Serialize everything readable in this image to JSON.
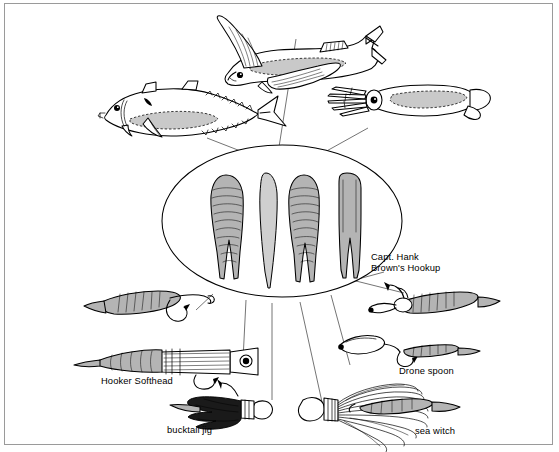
{
  "figure": {
    "kind": "illustration-diagram",
    "background_color": "#ffffff",
    "ink_color": "#000000",
    "border_color": "#9a9a9a",
    "fill_gray": "#b4b4b4",
    "fill_gray_light": "#d2d2d2",
    "fill_black": "#1a1a1a"
  },
  "baits": [
    {
      "id": "flyingfish",
      "name": "flying fish",
      "position": "top-center",
      "description": "Flying fish with long outstretched pectoral wing fins, forked tail, shaded flank"
    },
    {
      "id": "mackerel",
      "name": "mackerel",
      "position": "upper-left",
      "description": "Streamlined mackerel/tuna-type baitfish with finlets, deeply forked tail, shaded belly"
    },
    {
      "id": "squid",
      "name": "squid",
      "position": "upper-right",
      "description": "Squid with trailing tentacles, round eye, shaded mantle and tail fins"
    }
  ],
  "center_oval": {
    "name": "soft plastic lure skirts and bodies",
    "shapes": [
      {
        "id": "skirt-ribbed-split-1",
        "style": "ribbed split-tail",
        "fill": "#b4b4b4"
      },
      {
        "id": "body-taper-1",
        "style": "smooth single taper",
        "fill": "#c0c0c0"
      },
      {
        "id": "skirt-ribbed-split-2",
        "style": "ribbed split-tail",
        "fill": "#b4b4b4"
      },
      {
        "id": "skirt-plain-split",
        "style": "plain split-tail",
        "fill": "#b8b8b8"
      }
    ]
  },
  "lures": [
    {
      "id": "hookup",
      "label": "Capt. Hank\nBrown's Hookup",
      "label_lines": [
        "Capt. Hank",
        "Brown's Hookup"
      ],
      "position": "right",
      "description": "Jig head with wire bait-keeper and a ribbed soft plastic tail rigged on the hook"
    },
    {
      "id": "softhead",
      "label": "Hooker Softhead",
      "position": "left",
      "description": "Soft-head trolling lure with skirted body, round eye and trailing soft plastic tail"
    },
    {
      "id": "bucktail",
      "label": "bucktail jig",
      "position": "bottom-center-left",
      "description": "Dark bucktail jig with lead head, hook and dense black hair skirt"
    },
    {
      "id": "drone",
      "label": "Drone spoon",
      "position": "right-lower",
      "description": "Elongated Drone spoon with leader wire and trailing hook"
    },
    {
      "id": "seawitch",
      "label": "sea witch",
      "position": "bottom-right",
      "description": "Sea witch with bulbous head, banded collar and long flowing nylon skirt over a trolling bait"
    },
    {
      "id": "rigged-hook",
      "label": "",
      "position": "left-upper",
      "description": "Bare hook rigged with a ribbed soft plastic body"
    }
  ],
  "connectors": {
    "description": "Thin leader lines radiate from the central oval outward to each bait and lure",
    "count": 9
  }
}
